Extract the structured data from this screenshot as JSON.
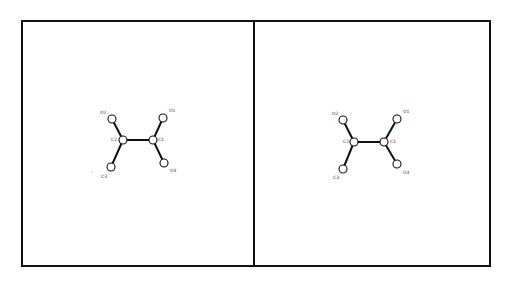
{
  "figure": {
    "panel_count": 2,
    "panels": [
      {
        "name": "left",
        "atoms": [
          {
            "id": "O2",
            "label": "O2"
          },
          {
            "id": "C2",
            "label": "C2"
          },
          {
            "id": "C3",
            "label": "C3"
          },
          {
            "id": "C1",
            "label": "C1"
          },
          {
            "id": "O1",
            "label": "O1"
          },
          {
            "id": "O3",
            "label": "O3"
          }
        ],
        "bonds": [
          [
            "C2",
            "C1"
          ],
          [
            "C2",
            "O2"
          ],
          [
            "C2",
            "C3"
          ],
          [
            "C1",
            "O1"
          ],
          [
            "C1",
            "O3"
          ]
        ]
      },
      {
        "name": "right",
        "atoms": [
          {
            "id": "O2",
            "label": "O2"
          },
          {
            "id": "C2",
            "label": "C2"
          },
          {
            "id": "C3",
            "label": "C3"
          },
          {
            "id": "C1",
            "label": "C1"
          },
          {
            "id": "O1",
            "label": "O1"
          },
          {
            "id": "O3",
            "label": "O3"
          }
        ],
        "bonds": [
          [
            "C2",
            "C1"
          ],
          [
            "C2",
            "O2"
          ],
          [
            "C2",
            "C3"
          ],
          [
            "C1",
            "O1"
          ],
          [
            "C1",
            "O3"
          ]
        ]
      }
    ]
  }
}
